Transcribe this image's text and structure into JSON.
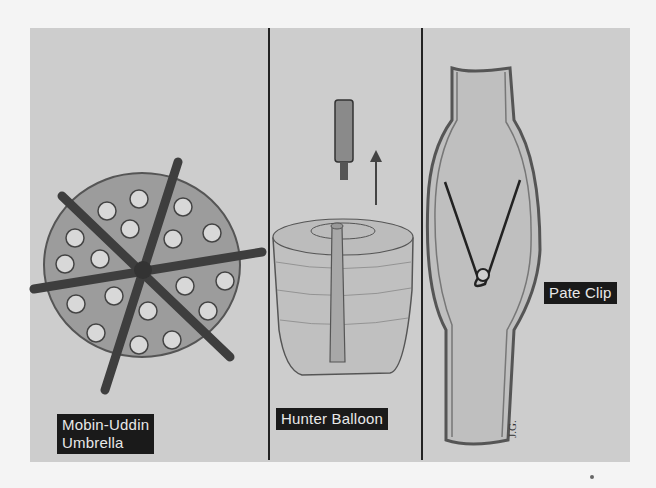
{
  "figure": {
    "background_color": "#cdcdcd",
    "panels": [
      {
        "id": "umbrella",
        "label_lines": [
          "Mobin-Uddin",
          "Umbrella"
        ],
        "description": "disc with six radiating struts and perforations"
      },
      {
        "id": "balloon",
        "label_lines": [
          "Hunter Balloon"
        ],
        "description": "detachable balloon with catheter tip and upward arrow"
      },
      {
        "id": "clip",
        "label_lines": [
          "Pate Clip"
        ],
        "description": "vessel with serrated external clip"
      }
    ],
    "signature": "J.G."
  }
}
